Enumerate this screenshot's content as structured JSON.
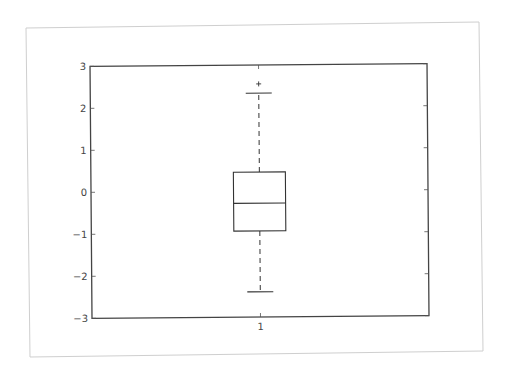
{
  "chart_data": {
    "type": "box",
    "title": "",
    "xlabel": "",
    "ylabel": "",
    "categories": [
      "1"
    ],
    "ylim": [
      -3,
      3
    ],
    "yticks": [
      -3,
      -2,
      -1,
      0,
      1,
      2,
      3
    ],
    "ytick_labels": [
      "−3",
      "−2",
      "−1",
      "0",
      "1",
      "2",
      "3"
    ],
    "xtick_labels": [
      "1"
    ],
    "grid": false,
    "legend": null,
    "series": [
      {
        "name": "1",
        "whisker_low": -2.4,
        "q1": -0.95,
        "median": -0.29,
        "q3": 0.45,
        "whisker_high": 2.33,
        "outliers": [
          2.55
        ]
      }
    ],
    "style": {
      "box_color": "#333333",
      "whisker_style": "dashed",
      "outlier_marker": "+"
    }
  }
}
